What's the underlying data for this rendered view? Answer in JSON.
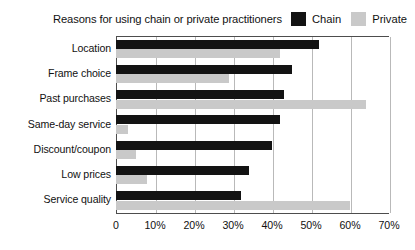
{
  "chart_data": {
    "type": "bar",
    "orientation": "horizontal",
    "title": "Reasons for using chain or private practitioners",
    "xlabel": "",
    "ylabel": "",
    "grid": true,
    "legend_position": "top-right",
    "xlim": [
      0,
      70
    ],
    "xticks": [
      "0",
      "10%",
      "20%",
      "30%",
      "40%",
      "50%",
      "60%",
      "70%"
    ],
    "xtick_values": [
      0,
      10,
      20,
      30,
      40,
      50,
      60,
      70
    ],
    "categories": [
      "Location",
      "Frame choice",
      "Past purchases",
      "Same-day service",
      "Discount/coupon",
      "Low prices",
      "Service quality"
    ],
    "series": [
      {
        "name": "Chain",
        "color": "#131313",
        "values": [
          52,
          45,
          43,
          42,
          40,
          34,
          32
        ]
      },
      {
        "name": "Private",
        "color": "#c9c9c9",
        "values": [
          42,
          29,
          64,
          3,
          5,
          8,
          60
        ]
      }
    ]
  },
  "legend": {
    "items": [
      {
        "label": "Chain",
        "color": "#131313"
      },
      {
        "label": "Private",
        "color": "#c9c9c9"
      }
    ]
  }
}
